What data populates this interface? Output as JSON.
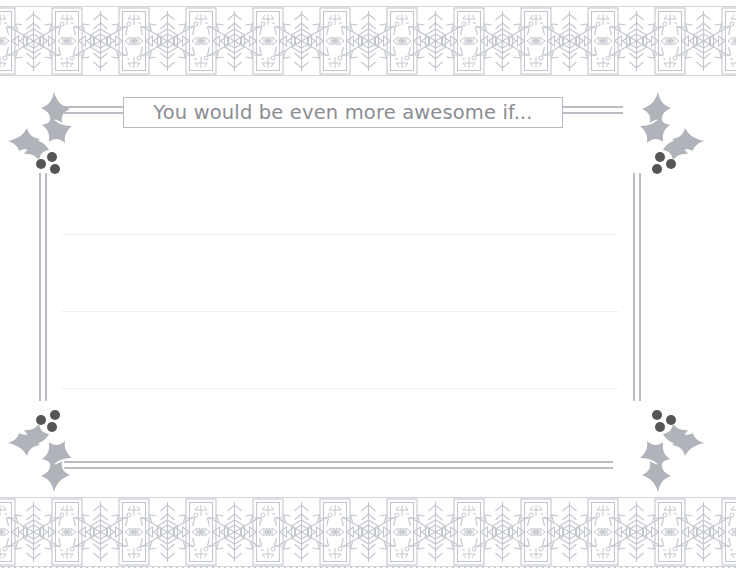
{
  "page": {
    "background_color": "#ffffff",
    "width": 736,
    "height": 576
  },
  "title": {
    "text": "You would be even more awesome if...",
    "text_color": "#8b8d93",
    "box_border_color": "#b5b8bf"
  },
  "decoration": {
    "ornament_color": "#c3c6cd",
    "leaf_color": "#b0b3ba",
    "berry_color": "#555555",
    "rule_color": "#b9bcc3",
    "writing_line_color": "#eceef1",
    "top_border_name": "snowflake-band",
    "bottom_border_name": "snowflake-band",
    "snowflake_repeat_count": 11,
    "holly_corners": [
      "top-left",
      "top-right",
      "bottom-left",
      "bottom-right"
    ],
    "berries_per_sprig": 3
  },
  "writing_area": {
    "line_count": 3,
    "line_y": [
      234,
      311,
      388
    ]
  }
}
